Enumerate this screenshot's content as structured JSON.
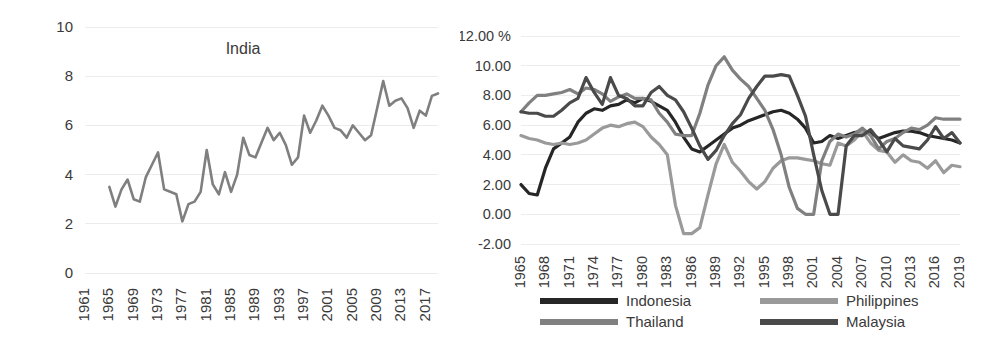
{
  "figure": {
    "background": "#ffffff",
    "panels": [
      "india",
      "asean"
    ]
  },
  "chart_data": [
    {
      "id": "india",
      "type": "line",
      "title": "India",
      "xlabel": "",
      "ylabel": "",
      "grid": true,
      "legend": false,
      "ylim": [
        0,
        10
      ],
      "yticks": [
        0,
        2,
        4,
        6,
        8,
        10
      ],
      "ytick_labels": [
        "0",
        "2",
        "4",
        "6",
        "8",
        "10"
      ],
      "xlim": [
        1961,
        2019
      ],
      "xtick_labels": [
        "1961",
        "1965",
        "1969",
        "1973",
        "1977",
        "1981",
        "1985",
        "1989",
        "1993",
        "1997",
        "2001",
        "2005",
        "2009",
        "2013",
        "2017"
      ],
      "xtick_values": [
        1961,
        1965,
        1969,
        1973,
        1977,
        1981,
        1985,
        1989,
        1993,
        1997,
        2001,
        2005,
        2009,
        2013,
        2017
      ],
      "series": [
        {
          "name": "India",
          "color": "#7f7f7f",
          "linewidth": 2.6,
          "x": [
            1965,
            1966,
            1967,
            1968,
            1969,
            1970,
            1971,
            1972,
            1973,
            1974,
            1975,
            1976,
            1977,
            1978,
            1979,
            1980,
            1981,
            1982,
            1983,
            1984,
            1985,
            1986,
            1987,
            1988,
            1989,
            1990,
            1991,
            1992,
            1993,
            1994,
            1995,
            1996,
            1997,
            1998,
            1999,
            2000,
            2001,
            2002,
            2003,
            2004,
            2005,
            2006,
            2007,
            2008,
            2009,
            2010,
            2011,
            2012,
            2013,
            2014,
            2015,
            2016,
            2017,
            2018,
            2019
          ],
          "values": [
            3.5,
            2.7,
            3.4,
            3.8,
            3.0,
            2.9,
            3.9,
            4.4,
            4.9,
            3.4,
            3.3,
            3.2,
            2.1,
            2.8,
            2.9,
            3.3,
            5.0,
            3.6,
            3.2,
            4.1,
            3.3,
            4.0,
            5.5,
            4.8,
            4.7,
            5.3,
            5.9,
            5.4,
            5.7,
            5.2,
            4.4,
            4.7,
            6.4,
            5.7,
            6.2,
            6.8,
            6.4,
            5.9,
            5.8,
            5.5,
            6.0,
            5.7,
            5.4,
            5.6,
            6.7,
            7.8,
            6.8,
            7.0,
            7.1,
            6.7,
            5.9,
            6.6,
            6.4,
            7.2,
            7.3,
            6.6
          ]
        }
      ]
    },
    {
      "id": "asean",
      "type": "line",
      "title": "",
      "xlabel": "",
      "ylabel": "%",
      "grid": true,
      "legend": true,
      "legend_position": "bottom",
      "ylim": [
        -2,
        12
      ],
      "yticks": [
        -2,
        0,
        2,
        4,
        6,
        8,
        10,
        12
      ],
      "ytick_labels": [
        "-2.00",
        "0.00",
        "2.00",
        "4.00",
        "6.00",
        "8.00",
        "10.00",
        "12.00 %"
      ],
      "xlim": [
        1965,
        2019
      ],
      "xtick_labels": [
        "1965",
        "1968",
        "1971",
        "1974",
        "1977",
        "1980",
        "1983",
        "1986",
        "1989",
        "1992",
        "1995",
        "1998",
        "2001",
        "2004",
        "2007",
        "2010",
        "2013",
        "2016",
        "2019"
      ],
      "xtick_values": [
        1965,
        1968,
        1971,
        1974,
        1977,
        1980,
        1983,
        1986,
        1989,
        1992,
        1995,
        1998,
        2001,
        2004,
        2007,
        2010,
        2013,
        2016,
        2019
      ],
      "series": [
        {
          "name": "Indonesia",
          "color": "#262626",
          "linewidth": 3.2,
          "x": [
            1965,
            1966,
            1967,
            1968,
            1969,
            1970,
            1971,
            1972,
            1973,
            1974,
            1975,
            1976,
            1977,
            1978,
            1979,
            1980,
            1981,
            1982,
            1983,
            1984,
            1985,
            1986,
            1987,
            1988,
            1989,
            1990,
            1991,
            1992,
            1993,
            1994,
            1995,
            1996,
            1997,
            1998,
            1999,
            2000,
            2001,
            2002,
            2003,
            2004,
            2005,
            2006,
            2007,
            2008,
            2009,
            2010,
            2011,
            2012,
            2013,
            2014,
            2015,
            2016,
            2017,
            2018,
            2019
          ],
          "values": [
            2.0,
            1.4,
            1.3,
            3.1,
            4.4,
            4.8,
            5.2,
            6.2,
            6.8,
            7.1,
            7.0,
            7.3,
            7.4,
            7.7,
            7.5,
            7.8,
            7.6,
            7.3,
            7.0,
            6.2,
            5.2,
            4.4,
            4.2,
            4.6,
            5.0,
            5.4,
            5.8,
            6.0,
            6.3,
            6.5,
            6.7,
            6.9,
            7.0,
            6.8,
            6.4,
            5.8,
            4.8,
            4.9,
            5.3,
            5.1,
            5.3,
            5.5,
            5.6,
            5.5,
            5.1,
            5.3,
            5.5,
            5.6,
            5.6,
            5.5,
            5.3,
            5.2,
            5.1,
            5.0,
            4.8
          ]
        },
        {
          "name": "Philippines",
          "color": "#9a9a9a",
          "linewidth": 3.2,
          "x": [
            1965,
            1966,
            1967,
            1968,
            1969,
            1970,
            1971,
            1972,
            1973,
            1974,
            1975,
            1976,
            1977,
            1978,
            1979,
            1980,
            1981,
            1982,
            1983,
            1984,
            1985,
            1986,
            1987,
            1988,
            1989,
            1990,
            1991,
            1992,
            1993,
            1994,
            1995,
            1996,
            1997,
            1998,
            1999,
            2000,
            2001,
            2002,
            2003,
            2004,
            2005,
            2006,
            2007,
            2008,
            2009,
            2010,
            2011,
            2012,
            2013,
            2014,
            2015,
            2016,
            2017,
            2018,
            2019
          ],
          "values": [
            5.3,
            5.1,
            5.0,
            4.8,
            4.7,
            4.8,
            4.7,
            4.8,
            5.0,
            5.4,
            5.8,
            6.0,
            5.9,
            6.1,
            6.2,
            5.9,
            5.2,
            4.7,
            4.0,
            0.6,
            -1.3,
            -1.3,
            -0.9,
            1.3,
            3.4,
            4.7,
            3.5,
            2.9,
            2.2,
            1.7,
            2.2,
            3.1,
            3.6,
            3.8,
            3.8,
            3.7,
            3.6,
            3.4,
            3.3,
            4.8,
            4.6,
            5.0,
            5.6,
            4.8,
            4.3,
            4.2,
            3.5,
            4.0,
            3.6,
            3.5,
            3.1,
            3.6,
            2.8,
            3.3,
            3.2
          ]
        },
        {
          "name": "Thailand",
          "color": "#808080",
          "linewidth": 3.2,
          "x": [
            1965,
            1966,
            1967,
            1968,
            1969,
            1970,
            1971,
            1972,
            1973,
            1974,
            1975,
            1976,
            1977,
            1978,
            1979,
            1980,
            1981,
            1982,
            1983,
            1984,
            1985,
            1986,
            1987,
            1988,
            1989,
            1990,
            1991,
            1992,
            1993,
            1994,
            1995,
            1996,
            1997,
            1998,
            1999,
            2000,
            2001,
            2002,
            2003,
            2004,
            2005,
            2006,
            2007,
            2008,
            2009,
            2010,
            2011,
            2012,
            2013,
            2014,
            2015,
            2016,
            2017,
            2018,
            2019
          ],
          "values": [
            6.9,
            7.5,
            8.0,
            8.0,
            8.1,
            8.2,
            8.4,
            8.1,
            8.5,
            8.4,
            8.1,
            7.6,
            7.9,
            8.1,
            7.8,
            7.8,
            7.7,
            6.8,
            6.2,
            5.4,
            5.3,
            5.3,
            6.8,
            8.7,
            10.0,
            10.6,
            9.7,
            9.1,
            8.6,
            7.8,
            7.0,
            5.7,
            4.0,
            1.8,
            0.4,
            0.0,
            0.0,
            3.6,
            4.9,
            5.4,
            5.2,
            5.4,
            5.8,
            5.3,
            4.4,
            4.9,
            5.1,
            5.5,
            5.8,
            5.7,
            6.0,
            6.5,
            6.4,
            6.4,
            6.4
          ]
        },
        {
          "name": "Malaysia",
          "color": "#4a4a4a",
          "linewidth": 3.2,
          "x": [
            1965,
            1966,
            1967,
            1968,
            1969,
            1970,
            1971,
            1972,
            1973,
            1974,
            1975,
            1976,
            1977,
            1978,
            1979,
            1980,
            1981,
            1982,
            1983,
            1984,
            1985,
            1986,
            1987,
            1988,
            1989,
            1990,
            1991,
            1992,
            1993,
            1994,
            1995,
            1996,
            1997,
            1998,
            1999,
            2000,
            2001,
            2002,
            2003,
            2004,
            2005,
            2006,
            2007,
            2008,
            2009,
            2010,
            2011,
            2012,
            2013,
            2014,
            2015,
            2016,
            2017,
            2018,
            2019
          ],
          "values": [
            6.9,
            6.8,
            6.8,
            6.6,
            6.6,
            7.0,
            7.5,
            7.8,
            9.2,
            8.2,
            7.4,
            9.2,
            8.0,
            7.8,
            7.3,
            7.3,
            8.2,
            8.6,
            8.0,
            7.7,
            6.9,
            5.8,
            4.6,
            3.7,
            4.3,
            5.3,
            6.1,
            6.7,
            7.8,
            8.6,
            9.3,
            9.3,
            9.4,
            9.3,
            8.0,
            6.6,
            4.0,
            1.6,
            0.0,
            0.0,
            4.6,
            5.3,
            5.3,
            5.7,
            5.0,
            4.2,
            5.1,
            4.6,
            4.5,
            4.4,
            5.0,
            5.9,
            5.1,
            5.5,
            4.8
          ]
        }
      ]
    }
  ]
}
